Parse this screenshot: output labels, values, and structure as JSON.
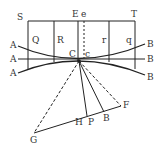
{
  "diagram": {
    "labels": {
      "S": "S",
      "E": "E",
      "e": "e",
      "T": "T",
      "Q": "Q",
      "R": "R",
      "r": "r",
      "q": "q",
      "A_top": "A",
      "A_mid": "A",
      "A_bot": "A",
      "B_top": "B",
      "B_mid": "B",
      "B_bot": "B",
      "C": "C",
      "c": "c",
      "F": "F",
      "G": "G",
      "H": "H",
      "P": "P",
      "B_low": "B"
    },
    "colors": {
      "stroke": "#222222",
      "background": "#ffffff"
    }
  }
}
